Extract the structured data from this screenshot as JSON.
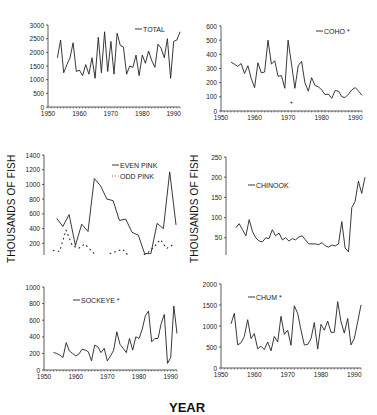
{
  "figure": {
    "y_axis_label": "THOUSANDS OF FISH",
    "x_axis_label": "YEAR"
  },
  "chart_data": [
    {
      "id": "total",
      "type": "line",
      "title": "",
      "legend": [
        "TOTAL"
      ],
      "legend_position": "top-right",
      "xlabel": "",
      "ylabel": "",
      "xlim": [
        1950,
        1992
      ],
      "ylim": [
        0,
        3000
      ],
      "xticks": [
        1950,
        1960,
        1970,
        1980,
        1990
      ],
      "yticks": [
        0,
        500,
        1000,
        1500,
        2000,
        2500,
        3000
      ],
      "series": [
        {
          "name": "TOTAL",
          "style": "solid",
          "x": [
            1953,
            1954,
            1955,
            1956,
            1957,
            1958,
            1959,
            1960,
            1961,
            1962,
            1963,
            1964,
            1965,
            1966,
            1967,
            1968,
            1969,
            1970,
            1971,
            1972,
            1973,
            1974,
            1975,
            1976,
            1977,
            1978,
            1979,
            1980,
            1981,
            1982,
            1983,
            1984,
            1985,
            1986,
            1987,
            1988,
            1989,
            1990,
            1991,
            1992
          ],
          "values": [
            1800,
            2450,
            1250,
            1550,
            1800,
            2350,
            1300,
            1350,
            1150,
            1550,
            1200,
            1800,
            1050,
            2550,
            1250,
            2750,
            1300,
            2400,
            1200,
            2700,
            2250,
            2200,
            1200,
            1500,
            1450,
            1900,
            1150,
            1900,
            1600,
            2050,
            1700,
            1450,
            2300,
            2150,
            1800,
            2500,
            1050,
            2400,
            2450,
            2750
          ]
        }
      ]
    },
    {
      "id": "coho",
      "type": "line",
      "title": "",
      "legend": [
        "COHO *"
      ],
      "legend_position": "top-right",
      "xlim": [
        1950,
        1992
      ],
      "ylim": [
        0,
        600
      ],
      "xticks": [
        1950,
        1960,
        1970,
        1980,
        1990
      ],
      "yticks": [
        0,
        100,
        200,
        300,
        400,
        500,
        600
      ],
      "annotations": [
        {
          "text": "+",
          "x": 1971,
          "y": 65
        }
      ],
      "series": [
        {
          "name": "COHO *",
          "style": "solid",
          "x": [
            1953,
            1954,
            1955,
            1956,
            1957,
            1958,
            1959,
            1960,
            1961,
            1962,
            1963,
            1964,
            1965,
            1966,
            1967,
            1968,
            1969,
            1970,
            1971,
            1972,
            1973,
            1974,
            1975,
            1976,
            1977,
            1978,
            1979,
            1980,
            1981,
            1982,
            1983,
            1984,
            1985,
            1986,
            1987,
            1988,
            1989,
            1990,
            1991,
            1992
          ],
          "values": [
            345,
            330,
            315,
            335,
            265,
            320,
            230,
            165,
            340,
            270,
            275,
            500,
            330,
            355,
            245,
            250,
            160,
            500,
            330,
            160,
            320,
            350,
            200,
            140,
            235,
            180,
            170,
            150,
            115,
            120,
            90,
            145,
            140,
            100,
            95,
            120,
            150,
            165,
            140,
            110
          ]
        }
      ]
    },
    {
      "id": "pink",
      "type": "line",
      "title": "",
      "legend": [
        "EVEN PINK",
        "ODD PINK"
      ],
      "legend_position": "top-right",
      "xlim": [
        1950,
        1992
      ],
      "ylim": [
        0,
        1400
      ],
      "xticks": [
        1950,
        1960,
        1970,
        1980,
        1990
      ],
      "yticks": [
        0,
        200,
        400,
        600,
        800,
        1000,
        1200,
        1400
      ],
      "series": [
        {
          "name": "EVEN PINK",
          "style": "solid",
          "x": [
            1954,
            1956,
            1958,
            1960,
            1962,
            1964,
            1966,
            1968,
            1970,
            1972,
            1974,
            1976,
            1978,
            1980,
            1982,
            1984,
            1986,
            1988,
            1990,
            1992
          ],
          "values": [
            540,
            430,
            590,
            170,
            460,
            360,
            1080,
            980,
            800,
            780,
            510,
            530,
            350,
            310,
            60,
            60,
            470,
            400,
            1170,
            450
          ]
        },
        {
          "name": "ODD PINK",
          "style": "dotted",
          "x": [
            1953,
            1955,
            1957,
            1959,
            1961,
            1963,
            1965,
            1967,
            1969,
            1971,
            1973,
            1975,
            1977,
            1979,
            1981,
            1983,
            1985,
            1987,
            1989,
            1991
          ],
          "values": [
            100,
            90,
            380,
            170,
            130,
            190,
            100,
            20,
            15,
            60,
            90,
            120,
            25,
            15,
            30,
            70,
            150,
            250,
            130,
            180
          ]
        }
      ]
    },
    {
      "id": "chinook",
      "type": "line",
      "title": "",
      "legend": [
        "CHINOOK"
      ],
      "legend_position": "upper-left",
      "xlim": [
        1950,
        1992
      ],
      "ylim": [
        0,
        250
      ],
      "xticks": [
        1950,
        1960,
        1970,
        1980,
        1990
      ],
      "yticks": [
        0,
        50,
        100,
        150,
        200,
        250
      ],
      "series": [
        {
          "name": "CHINOOK",
          "style": "solid",
          "x": [
            1953,
            1954,
            1955,
            1956,
            1957,
            1958,
            1959,
            1960,
            1961,
            1962,
            1963,
            1964,
            1965,
            1966,
            1967,
            1968,
            1969,
            1970,
            1971,
            1972,
            1973,
            1974,
            1975,
            1976,
            1977,
            1978,
            1979,
            1980,
            1981,
            1982,
            1983,
            1984,
            1985,
            1986,
            1987,
            1988,
            1989,
            1990,
            1991,
            1992
          ],
          "values": [
            75,
            85,
            70,
            55,
            95,
            65,
            50,
            42,
            40,
            50,
            48,
            70,
            55,
            62,
            45,
            50,
            42,
            48,
            45,
            52,
            55,
            45,
            35,
            35,
            35,
            33,
            38,
            30,
            27,
            32,
            30,
            35,
            90,
            25,
            15,
            125,
            140,
            190,
            160,
            200
          ]
        }
      ]
    },
    {
      "id": "sockeye",
      "type": "line",
      "title": "",
      "legend": [
        "SOCKEYE *"
      ],
      "legend_position": "upper-left",
      "xlim": [
        1950,
        1992
      ],
      "ylim": [
        0,
        1000
      ],
      "xticks": [
        1950,
        1960,
        1970,
        1980,
        1990
      ],
      "yticks": [
        0,
        200,
        400,
        600,
        800,
        1000
      ],
      "series": [
        {
          "name": "SOCKEYE *",
          "style": "solid",
          "x": [
            1953,
            1954,
            1955,
            1956,
            1957,
            1958,
            1959,
            1960,
            1961,
            1962,
            1963,
            1964,
            1965,
            1966,
            1967,
            1968,
            1969,
            1970,
            1971,
            1972,
            1973,
            1974,
            1975,
            1976,
            1977,
            1978,
            1979,
            1980,
            1981,
            1982,
            1983,
            1984,
            1985,
            1986,
            1987,
            1988,
            1989,
            1990,
            1991,
            1992
          ],
          "values": [
            210,
            200,
            180,
            150,
            330,
            230,
            200,
            170,
            190,
            250,
            240,
            220,
            110,
            300,
            280,
            210,
            260,
            110,
            170,
            240,
            460,
            310,
            260,
            210,
            380,
            240,
            400,
            380,
            490,
            650,
            710,
            340,
            380,
            380,
            560,
            670,
            80,
            150,
            770,
            440
          ]
        }
      ]
    },
    {
      "id": "chum",
      "type": "line",
      "title": "",
      "legend": [
        "CHUM *"
      ],
      "legend_position": "upper-left",
      "xlim": [
        1950,
        1992
      ],
      "ylim": [
        0,
        2000
      ],
      "xticks": [
        1950,
        1960,
        1970,
        1980,
        1990
      ],
      "yticks": [
        0,
        500,
        1000,
        1500,
        2000
      ],
      "series": [
        {
          "name": "CHUM *",
          "style": "solid",
          "x": [
            1953,
            1954,
            1955,
            1956,
            1957,
            1958,
            1959,
            1960,
            1961,
            1962,
            1963,
            1964,
            1965,
            1966,
            1967,
            1968,
            1969,
            1970,
            1971,
            1972,
            1973,
            1974,
            1975,
            1976,
            1977,
            1978,
            1979,
            1980,
            1981,
            1982,
            1983,
            1984,
            1985,
            1986,
            1987,
            1988,
            1989,
            1990,
            1991,
            1992
          ],
          "values": [
            1050,
            1300,
            550,
            600,
            750,
            1150,
            700,
            820,
            460,
            520,
            440,
            620,
            410,
            750,
            620,
            1230,
            800,
            900,
            540,
            1480,
            1300,
            900,
            550,
            560,
            700,
            1080,
            450,
            1040,
            900,
            1120,
            850,
            850,
            1580,
            1100,
            830,
            1180,
            550,
            700,
            1100,
            1500
          ]
        }
      ]
    }
  ]
}
